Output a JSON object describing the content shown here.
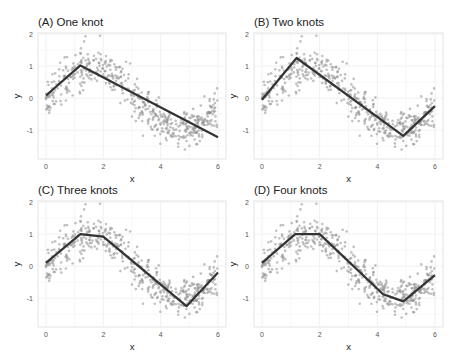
{
  "chart_data": [
    {
      "type": "scatter",
      "title": "(A) One knot",
      "xlabel": "x",
      "ylabel": "y",
      "xlim": [
        0,
        6
      ],
      "ylim": [
        -1.9,
        2
      ],
      "xticks": [
        0,
        2,
        4,
        6
      ],
      "yticks": [
        -1,
        0,
        1,
        2
      ],
      "grid": true,
      "scatter_description": "~500 noisy points y = sin(x) + noise, x uniform on [0, 6]",
      "fit_line": {
        "knots": [
          1.2
        ],
        "x": [
          0,
          1.2,
          6
        ],
        "y": [
          0.08,
          1.02,
          -1.22
        ]
      }
    },
    {
      "type": "scatter",
      "title": "(B) Two knots",
      "xlabel": "x",
      "ylabel": "y",
      "xlim": [
        0,
        6
      ],
      "ylim": [
        -1.9,
        2
      ],
      "xticks": [
        0,
        2,
        4,
        6
      ],
      "yticks": [
        -1,
        0,
        1,
        2
      ],
      "grid": true,
      "scatter_description": "~500 noisy points y = sin(x) + noise, x uniform on [0, 6]",
      "fit_line": {
        "knots": [
          1.2,
          4.9
        ],
        "x": [
          0,
          1.2,
          4.9,
          6
        ],
        "y": [
          -0.05,
          1.25,
          -1.18,
          -0.25
        ]
      }
    },
    {
      "type": "scatter",
      "title": "(C) Three knots",
      "xlabel": "x",
      "ylabel": "y",
      "xlim": [
        0,
        6
      ],
      "ylim": [
        -1.9,
        2
      ],
      "xticks": [
        0,
        2,
        4,
        6
      ],
      "yticks": [
        -1,
        0,
        1,
        2
      ],
      "grid": true,
      "scatter_description": "~500 noisy points y = sin(x) + noise, x uniform on [0, 6]",
      "fit_line": {
        "knots": [
          1.2,
          2.0,
          4.9
        ],
        "x": [
          0,
          1.2,
          2.0,
          4.9,
          6
        ],
        "y": [
          0.1,
          1.0,
          0.92,
          -1.25,
          -0.2
        ]
      }
    },
    {
      "type": "scatter",
      "title": "(D) Four knots",
      "xlabel": "x",
      "ylabel": "y",
      "xlim": [
        0,
        6
      ],
      "ylim": [
        -1.9,
        2
      ],
      "xticks": [
        0,
        2,
        4,
        6
      ],
      "yticks": [
        -1,
        0,
        1,
        2
      ],
      "grid": true,
      "scatter_description": "~500 noisy points y = sin(x) + noise, x uniform on [0, 6]",
      "fit_line": {
        "knots": [
          1.15,
          2.0,
          4.2,
          4.9
        ],
        "x": [
          0,
          1.15,
          2.0,
          4.2,
          4.9,
          6
        ],
        "y": [
          0.1,
          1.0,
          1.0,
          -0.88,
          -1.1,
          -0.28
        ]
      }
    }
  ],
  "scatter": {
    "n": 520,
    "noise_sd": 0.3,
    "seed": 7,
    "point_color": "#8c8c8c",
    "point_opacity": 0.55
  },
  "style": {
    "line_color": "#333333",
    "grid_color": "#ececec",
    "panel_border": "#e3e3e3",
    "tick_color": "#555555"
  },
  "panels_layout": [
    {
      "plot": [
        38,
        33,
        226,
        159
      ],
      "title_xy": [
        38,
        26
      ]
    },
    {
      "plot": [
        254,
        33,
        443,
        159
      ],
      "title_xy": [
        254,
        26
      ]
    },
    {
      "plot": [
        38,
        201,
        226,
        327
      ],
      "title_xy": [
        38,
        194
      ]
    },
    {
      "plot": [
        254,
        201,
        443,
        327
      ],
      "title_xy": [
        254,
        194
      ]
    }
  ]
}
